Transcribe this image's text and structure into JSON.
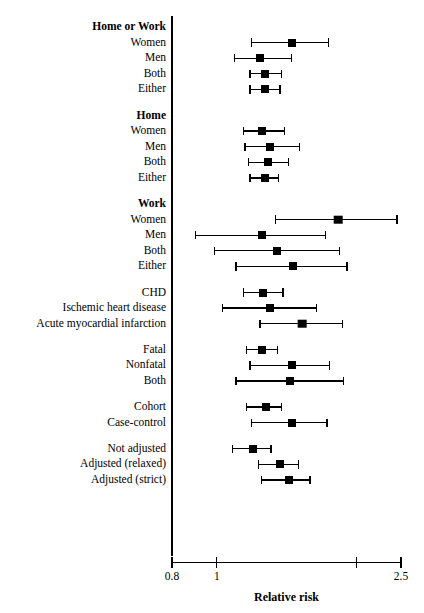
{
  "figure": {
    "type": "forest-plot",
    "axis_title": "Relative risk",
    "axis_scale": "log",
    "axis_min": 0.8,
    "axis_max": 2.5,
    "tick_labels": [
      "0.8",
      "1",
      "2.5"
    ],
    "tick_values": [
      0.8,
      1,
      2,
      2.5
    ],
    "labeled_ticks": [
      0.8,
      1,
      2.5
    ],
    "reference_line": null
  },
  "chart_data": {
    "type": "forest",
    "title": "",
    "xlabel": "Relative risk",
    "ylabel": "",
    "xscale": "log",
    "xlim": [
      0.8,
      2.5
    ],
    "xticks": [
      0.8,
      1,
      2,
      2.5
    ],
    "xticklabels": [
      "0.8",
      "1",
      "",
      "2.5"
    ],
    "grid": false,
    "legend": null,
    "groups": [
      {
        "heading": "Home or Work",
        "rows": [
          {
            "label": "Women",
            "rr": 1.45,
            "lo": 1.19,
            "hi": 1.74
          },
          {
            "label": "Men",
            "rr": 1.24,
            "lo": 1.09,
            "hi": 1.45
          },
          {
            "label": "Both",
            "rr": 1.27,
            "lo": 1.18,
            "hi": 1.38
          },
          {
            "label": "Either",
            "rr": 1.27,
            "lo": 1.18,
            "hi": 1.37
          }
        ]
      },
      {
        "heading": "Home",
        "rows": [
          {
            "label": "Women",
            "rr": 1.25,
            "lo": 1.14,
            "hi": 1.4
          },
          {
            "label": "Men",
            "rr": 1.3,
            "lo": 1.15,
            "hi": 1.51
          },
          {
            "label": "Both",
            "rr": 1.29,
            "lo": 1.17,
            "hi": 1.43
          },
          {
            "label": "Either",
            "rr": 1.27,
            "lo": 1.18,
            "hi": 1.36
          }
        ]
      },
      {
        "heading": "Work",
        "rows": [
          {
            "label": "Women",
            "rr": 1.83,
            "lo": 1.34,
            "hi": 2.45
          },
          {
            "label": "Men",
            "rr": 1.25,
            "lo": 0.9,
            "hi": 1.72
          },
          {
            "label": "Both",
            "rr": 1.35,
            "lo": 0.99,
            "hi": 1.84
          },
          {
            "label": "Either",
            "rr": 1.46,
            "lo": 1.1,
            "hi": 1.91
          }
        ]
      },
      {
        "heading": "",
        "rows": [
          {
            "label": "CHD",
            "rr": 1.26,
            "lo": 1.14,
            "hi": 1.39
          },
          {
            "label": "Ischemic heart disease",
            "rr": 1.3,
            "lo": 1.03,
            "hi": 1.64
          },
          {
            "label": "Acute myocardial infarction",
            "rr": 1.53,
            "lo": 1.24,
            "hi": 1.87
          }
        ]
      },
      {
        "heading": "",
        "rows": [
          {
            "label": "Fatal",
            "rr": 1.25,
            "lo": 1.16,
            "hi": 1.35
          },
          {
            "label": "Nonfatal",
            "rr": 1.45,
            "lo": 1.18,
            "hi": 1.75
          },
          {
            "label": "Both",
            "rr": 1.44,
            "lo": 1.1,
            "hi": 1.88
          }
        ]
      },
      {
        "heading": "",
        "rows": [
          {
            "label": "Cohort",
            "rr": 1.28,
            "lo": 1.16,
            "hi": 1.38
          },
          {
            "label": "Case-control",
            "rr": 1.45,
            "lo": 1.19,
            "hi": 1.73
          }
        ]
      },
      {
        "heading": "",
        "rows": [
          {
            "label": "Not adjusted",
            "rr": 1.2,
            "lo": 1.08,
            "hi": 1.31
          },
          {
            "label": "Adjusted (relaxed)",
            "rr": 1.37,
            "lo": 1.23,
            "hi": 1.5
          },
          {
            "label": "Adjusted (strict)",
            "rr": 1.43,
            "lo": 1.25,
            "hi": 1.59
          }
        ]
      }
    ]
  },
  "colors": {
    "ink": "#000000",
    "background": "#ffffff"
  }
}
